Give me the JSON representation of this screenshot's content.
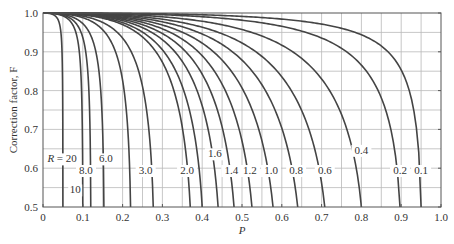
{
  "chart_data": {
    "type": "line",
    "title": "",
    "xlabel": "P",
    "ylabel": "Correction factor, F",
    "xlim": [
      0,
      1.0
    ],
    "ylim": [
      0.5,
      1.0
    ],
    "grid": true,
    "legend": "inline curve labels",
    "x_ticks": [
      "0",
      "0.1",
      "0.2",
      "0.3",
      "0.4",
      "0.5",
      "0.6",
      "0.7",
      "0.8",
      "0.9",
      "1.0"
    ],
    "y_ticks": [
      "0.5",
      "0.6",
      "0.7",
      "0.8",
      "0.9",
      "1.0"
    ],
    "series": [
      {
        "name": "R = 20",
        "R": 20,
        "label": "R = 20",
        "p_at_F05": 0.05
      },
      {
        "name": "10",
        "R": 10,
        "label": "10",
        "p_at_F05": 0.1
      },
      {
        "name": "8.0",
        "R": 8.0,
        "label": "8.0",
        "p_at_F05": 0.12
      },
      {
        "name": "6.0",
        "R": 6.0,
        "label": "6.0",
        "p_at_F05": 0.153
      },
      {
        "name": "4.0",
        "R": 4.0,
        "label": "",
        "p_at_F05": 0.22
      },
      {
        "name": "3.0",
        "R": 3.0,
        "label": "3.0",
        "p_at_F05": 0.277
      },
      {
        "name": "2.0",
        "R": 2.0,
        "label": "2.0",
        "p_at_F05": 0.37
      },
      {
        "name": "1.8",
        "R": 1.8,
        "label": "",
        "p_at_F05": 0.4
      },
      {
        "name": "1.6",
        "R": 1.6,
        "label": "1.6",
        "p_at_F05": 0.44
      },
      {
        "name": "1.4",
        "R": 1.4,
        "label": "1.4",
        "p_at_F05": 0.48
      },
      {
        "name": "1.2",
        "R": 1.2,
        "label": "1.2",
        "p_at_F05": 0.525
      },
      {
        "name": "1.0",
        "R": 1.0,
        "label": "1.0",
        "p_at_F05": 0.578
      },
      {
        "name": "0.8",
        "R": 0.8,
        "label": "0.8",
        "p_at_F05": 0.64
      },
      {
        "name": "0.6",
        "R": 0.6,
        "label": "0.6",
        "p_at_F05": 0.708
      },
      {
        "name": "0.4",
        "R": 0.4,
        "label": "0.4",
        "p_at_F05": 0.8
      },
      {
        "name": "0.2",
        "R": 0.2,
        "label": "0.2",
        "p_at_F05": 0.897
      },
      {
        "name": "0.1",
        "R": 0.1,
        "label": "0.1",
        "p_at_F05": 0.95
      }
    ],
    "label_positions": [
      {
        "text": "R = 20",
        "x": 0.048,
        "y": 0.615,
        "italic_prefix": true
      },
      {
        "text": "10",
        "x": 0.081,
        "y": 0.535
      },
      {
        "text": "8.0",
        "x": 0.108,
        "y": 0.585
      },
      {
        "text": "6.0",
        "x": 0.158,
        "y": 0.615
      },
      {
        "text": "3.0",
        "x": 0.258,
        "y": 0.585
      },
      {
        "text": "2.0",
        "x": 0.362,
        "y": 0.585
      },
      {
        "text": "1.6",
        "x": 0.432,
        "y": 0.628
      },
      {
        "text": "1.4",
        "x": 0.473,
        "y": 0.585
      },
      {
        "text": "1.2",
        "x": 0.52,
        "y": 0.585
      },
      {
        "text": "1.0",
        "x": 0.573,
        "y": 0.585
      },
      {
        "text": "0.8",
        "x": 0.636,
        "y": 0.585
      },
      {
        "text": "0.6",
        "x": 0.708,
        "y": 0.585
      },
      {
        "text": "0.4",
        "x": 0.8,
        "y": 0.637
      },
      {
        "text": "0.2",
        "x": 0.897,
        "y": 0.585
      },
      {
        "text": "0.1",
        "x": 0.95,
        "y": 0.585
      }
    ]
  },
  "axes": {
    "x_label": "P",
    "y_label": "Correction factor, F"
  }
}
